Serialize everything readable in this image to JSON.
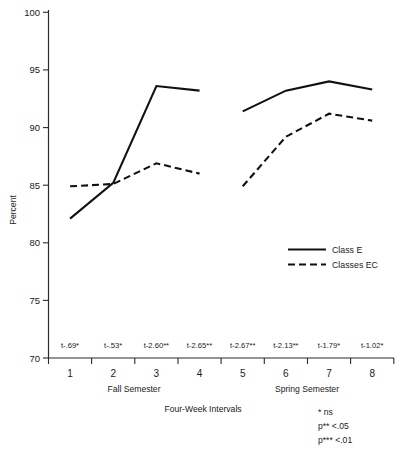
{
  "chart_data": {
    "type": "line",
    "title": "",
    "xlabel": "Four-Week Intervals",
    "ylabel": "Percent",
    "ylim": [
      70,
      100
    ],
    "yticks": [
      70,
      75,
      80,
      85,
      90,
      95,
      100
    ],
    "grid": false,
    "legend_position": "inside-right",
    "categories": [
      "1",
      "2",
      "3",
      "4",
      "5",
      "6",
      "7",
      "8"
    ],
    "group_labels": [
      "Fall Semester",
      "Spring Semester"
    ],
    "series": [
      {
        "name": "Class E",
        "style": "solid",
        "values": [
          82.1,
          85.2,
          93.6,
          93.2,
          91.4,
          93.2,
          94.0,
          93.3
        ]
      },
      {
        "name": "Classes EC",
        "style": "dashed",
        "values": [
          84.9,
          85.1,
          86.9,
          86.0,
          84.9,
          89.2,
          91.2,
          90.6
        ]
      }
    ],
    "annotations": [
      "t-.69*",
      "t-.53*",
      "t-2.60**",
      "t-2.65**",
      "t-2.67**",
      "t-2.13**",
      "t-1.79*",
      "t-1.02*"
    ],
    "footnotes": [
      "*  ns",
      "p** <.05",
      "p*** <.01"
    ]
  },
  "axis": {
    "y_label": "Percent",
    "x_label": "Four-Week Intervals",
    "y_ticks": [
      "100",
      "95",
      "90",
      "85",
      "80",
      "75",
      "70"
    ],
    "x_ticks": [
      "1",
      "2",
      "3",
      "4",
      "5",
      "6",
      "7",
      "8"
    ]
  },
  "semesters": {
    "fall": "Fall Semester",
    "spring": "Spring Semester"
  },
  "legend": {
    "items": [
      {
        "label": "Class E"
      },
      {
        "label": "Classes EC"
      }
    ]
  },
  "annotations": {
    "t1": "t-.69*",
    "t2": "t-.53*",
    "t3": "t-2.60**",
    "t4": "t-2.65**",
    "t5": "t-2.67**",
    "t6": "t-2.13**",
    "t7": "t-1.79*",
    "t8": "t-1.02*"
  },
  "footnotes": {
    "l1": "*  ns",
    "l2": "p** <.05",
    "l3": "p*** <.01"
  },
  "colors": {
    "line": "#111111",
    "axis": "#2b2b2b",
    "background": "#ffffff"
  }
}
